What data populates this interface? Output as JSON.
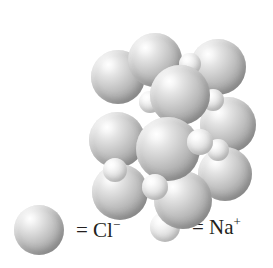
{
  "figure": {
    "background_color": "#ffffff"
  },
  "chart_data": {
    "type": "scatter",
    "xlabel": "",
    "ylabel": "",
    "grid": false,
    "legend_position": "bottom",
    "series": [
      {
        "name": "Cl⁻",
        "ion_label": "Cl",
        "charge": "−",
        "color": "#b4b4b4",
        "radius_px": 27,
        "points": [
          {
            "x": 73,
            "y": 55,
            "r": 27,
            "z": 2
          },
          {
            "x": 110,
            "y": 38,
            "r": 27,
            "z": 3
          },
          {
            "x": 173,
            "y": 45,
            "r": 28,
            "z": 2
          },
          {
            "x": 135,
            "y": 73,
            "r": 30,
            "z": 5
          },
          {
            "x": 183,
            "y": 103,
            "r": 28,
            "z": 3
          },
          {
            "x": 72,
            "y": 118,
            "r": 28,
            "z": 4
          },
          {
            "x": 123,
            "y": 127,
            "r": 32,
            "z": 6
          },
          {
            "x": 180,
            "y": 152,
            "r": 27,
            "z": 3
          },
          {
            "x": 75,
            "y": 170,
            "r": 28,
            "z": 4
          },
          {
            "x": 138,
            "y": 178,
            "r": 29,
            "z": 5
          }
        ]
      },
      {
        "name": "Na⁺",
        "ion_label": "Na",
        "charge": "+",
        "color": "#dcdcdc",
        "radius_px": 12,
        "points": [
          {
            "x": 145,
            "y": 42,
            "r": 11,
            "z": 4
          },
          {
            "x": 105,
            "y": 80,
            "r": 11,
            "z": 4
          },
          {
            "x": 168,
            "y": 78,
            "r": 11,
            "z": 4
          },
          {
            "x": 70,
            "y": 148,
            "r": 12,
            "z": 5
          },
          {
            "x": 155,
            "y": 120,
            "r": 13,
            "z": 7
          },
          {
            "x": 173,
            "y": 128,
            "r": 11,
            "z": 4
          },
          {
            "x": 110,
            "y": 165,
            "r": 13,
            "z": 7
          }
        ]
      }
    ]
  },
  "legend": {
    "items": [
      {
        "id": "chloride",
        "equals": "=",
        "symbol": "Cl",
        "charge": "−",
        "full_label": "= Cl⁻",
        "swatch": "large-gray-sphere"
      },
      {
        "id": "sodium",
        "equals": "=",
        "symbol": "Na",
        "charge": "+",
        "full_label": "= Na⁺",
        "swatch": "small-light-sphere"
      }
    ]
  }
}
